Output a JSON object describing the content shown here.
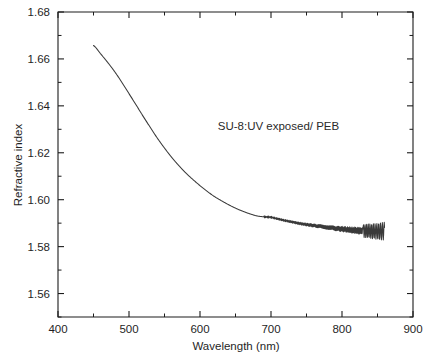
{
  "figure": {
    "background_color": "#ffffff",
    "axis_color": "#1c1c1c",
    "curve_color": "#3a3a3a"
  },
  "axes": {
    "x_title": "Wavelength (nm)",
    "y_title": "Refractive index",
    "x_tick_labels": [
      "400",
      "500",
      "600",
      "700",
      "800",
      "900"
    ],
    "y_tick_labels": [
      "1.56",
      "1.58",
      "1.60",
      "1.62",
      "1.64",
      "1.66",
      "1.68"
    ]
  },
  "annotations": {
    "sample_label": "SU-8:UV exposed/ PEB"
  },
  "chart_data": {
    "type": "line",
    "title": "",
    "subtitle": "",
    "xlabel": "Wavelength (nm)",
    "ylabel": "Refractive index",
    "xlim": [
      400,
      900
    ],
    "ylim": [
      1.55,
      1.68
    ],
    "xticks": [
      400,
      500,
      600,
      700,
      800,
      900
    ],
    "yticks": [
      1.56,
      1.58,
      1.6,
      1.62,
      1.64,
      1.66,
      1.68
    ],
    "x_minor_tick_step": 50,
    "y_minor_tick_step": 0.01,
    "grid": false,
    "legend": false,
    "legend_position": "none",
    "annotations": [
      {
        "text": "SU-8:UV exposed/ PEB",
        "x": 625,
        "y": 1.6295
      }
    ],
    "series": [
      {
        "name": "SU-8 UV exposed / PEB",
        "color": "#3a3a3a",
        "line_width": 1.05,
        "marker": "none",
        "x": [
          450,
          460,
          470,
          480,
          490,
          500,
          510,
          520,
          530,
          540,
          550,
          560,
          570,
          580,
          590,
          600,
          610,
          620,
          630,
          640,
          650,
          660,
          670,
          680,
          690,
          700,
          710,
          720,
          730,
          740,
          750,
          760,
          770,
          780,
          790,
          800,
          810,
          820,
          830,
          840,
          850,
          860
        ],
        "y": [
          1.6657,
          1.6622,
          1.6585,
          1.6545,
          1.65,
          1.6452,
          1.6404,
          1.6355,
          1.6308,
          1.6262,
          1.622,
          1.6181,
          1.6146,
          1.6114,
          1.6086,
          1.606,
          1.6036,
          1.6014,
          1.5996,
          1.5979,
          1.5964,
          1.5951,
          1.594,
          1.5931,
          1.5927,
          1.5925,
          1.5918,
          1.5911,
          1.5905,
          1.5899,
          1.5894,
          1.589,
          1.5886,
          1.5882,
          1.5878,
          1.5875,
          1.5872,
          1.5869,
          1.5867,
          1.5866,
          1.5865,
          1.5866
        ],
        "noise_description": "Interference fringe oscillation superimposed on the smooth trend, beginning near 690 nm and growing in amplitude toward 860 nm (peak-to-peak roughly 0.0008 at 700 nm rising to about 0.004 near 855 nm).",
        "fringe_onset_nm": 690,
        "fringe_amplitude_start": 0.0004,
        "fringe_amplitude_end": 0.0022
      }
    ]
  }
}
